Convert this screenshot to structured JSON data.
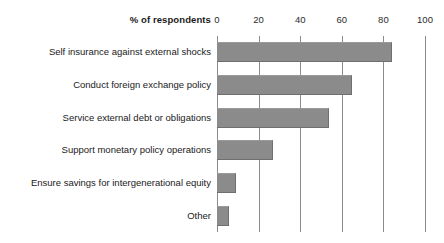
{
  "chart": {
    "axis_title": "% of respondents",
    "tick_labels": [
      "0",
      "20",
      "40",
      "60",
      "80",
      "100"
    ]
  },
  "chart_data": {
    "type": "bar",
    "orientation": "horizontal",
    "title": "",
    "subtitle": "",
    "xlabel": "% of respondents",
    "ylabel": "",
    "xlim": [
      0,
      100
    ],
    "xticks": [
      0,
      20,
      40,
      60,
      80,
      100
    ],
    "grid": "vertical",
    "legend": "none",
    "bar_color": "#8b8b8b",
    "background_color": "#ffffff",
    "categories": [
      "Self insurance against external shocks",
      "Conduct foreign exchange policy",
      "Service external debt or obligations",
      "Support monetary policy operations",
      "Ensure savings for intergenerational equity",
      "Other"
    ],
    "values": [
      84,
      65,
      54,
      27,
      9,
      6
    ]
  }
}
